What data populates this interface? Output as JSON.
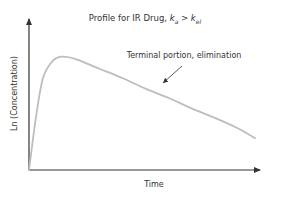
{
  "chart_data": {
    "type": "line",
    "title": "Profile for IR Drug, ka > kel",
    "title_parts": {
      "prefix": "Profile for IR Drug, ",
      "k1": "k",
      "k1_sub": "a",
      "op": " > ",
      "k2": "k",
      "k2_sub": "el"
    },
    "xlabel": "Time",
    "ylabel": "Ln (Concentration)",
    "grid": false,
    "legend": null,
    "x_ticks": [],
    "y_ticks": [],
    "series": [
      {
        "name": "ln(C) vs time",
        "color": "#bdbdbd",
        "x": [
          0,
          0.03,
          0.06,
          0.1,
          0.14,
          0.2,
          0.3,
          0.4,
          0.5,
          0.6,
          0.7,
          0.8,
          0.9,
          0.97
        ],
        "y": [
          0,
          0.45,
          0.78,
          0.92,
          0.96,
          0.94,
          0.86,
          0.78,
          0.69,
          0.61,
          0.52,
          0.44,
          0.35,
          0.27
        ]
      }
    ],
    "annotations": [
      {
        "text": "Terminal portion, elimination",
        "arrow_to": {
          "x": 0.57,
          "y": 0.6
        }
      }
    ],
    "axis_ranges": {
      "x": [
        0,
        1
      ],
      "y": [
        0,
        1
      ]
    }
  },
  "colors": {
    "axis": "#333333",
    "curve": "#bdbdbd",
    "text": "#333333"
  }
}
